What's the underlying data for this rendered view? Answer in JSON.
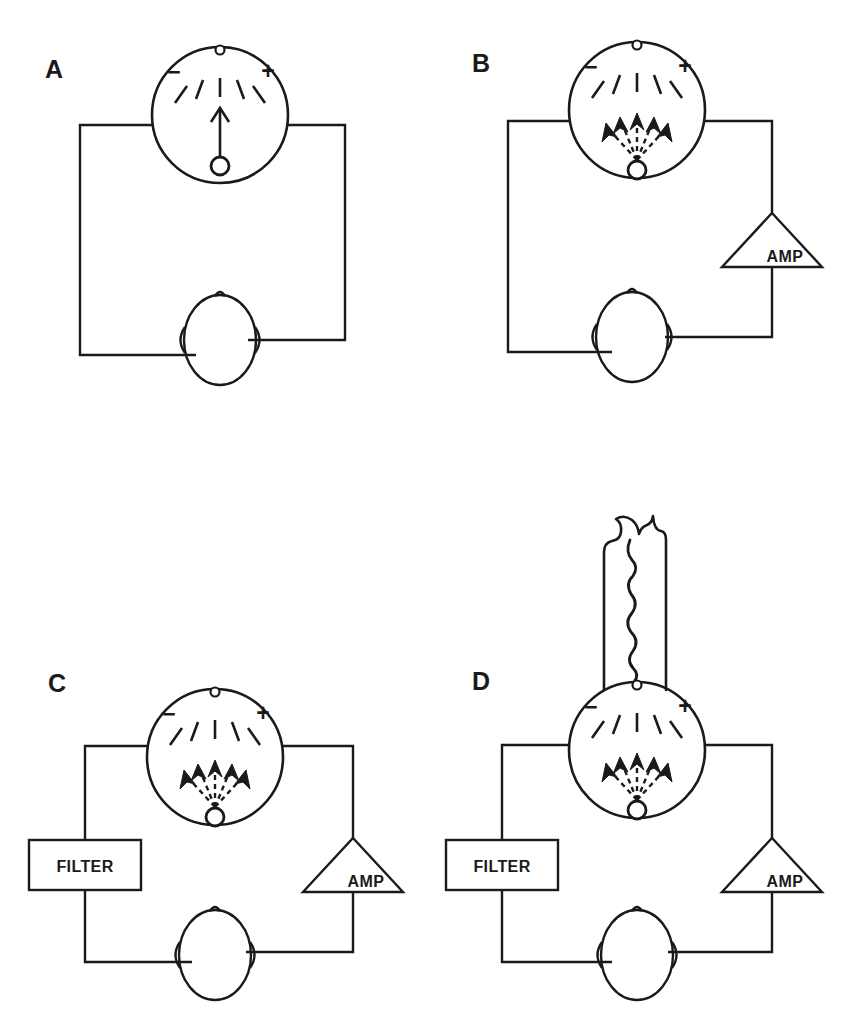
{
  "figure": {
    "background_color": "#ffffff",
    "ink_color": "#1a1a1a",
    "width": 845,
    "height": 1036
  },
  "meter": {
    "scale_minus": "−",
    "scale_plus": "+",
    "tick_count": 5,
    "top_dot_name": "dial-top-dot"
  },
  "components": {
    "amp_label": "AMP",
    "filter_label": "FILTER"
  },
  "panels": [
    {
      "id": "A",
      "label": "A",
      "label_x": 45,
      "label_y": 78,
      "meter_cx": 220,
      "meter_cy": 115,
      "meter_r": 68,
      "head_cx": 220,
      "head_cy": 340,
      "needle_mode": "steady",
      "has_amp": false,
      "has_filter": false,
      "has_strip": false,
      "left_wire_x": 80,
      "right_wire_x": 345,
      "bottom_wire_y": 355,
      "wire_top_y": 125
    },
    {
      "id": "B",
      "label": "B",
      "label_x": 472,
      "label_y": 72,
      "meter_cx": 637,
      "meter_cy": 110,
      "meter_r": 68,
      "head_cx": 632,
      "head_cy": 337,
      "needle_mode": "fluttering",
      "has_amp": true,
      "has_filter": false,
      "has_strip": false,
      "left_wire_x": 508,
      "right_wire_x": 772,
      "bottom_wire_y": 352,
      "wire_top_y": 121,
      "amp_cx": 772,
      "amp_cy": 240
    },
    {
      "id": "C",
      "label": "C",
      "label_x": 48,
      "label_y": 692,
      "meter_cx": 215,
      "meter_cy": 757,
      "meter_r": 68,
      "head_cx": 215,
      "head_cy": 955,
      "needle_mode": "fluttering",
      "has_amp": true,
      "has_filter": true,
      "has_strip": false,
      "left_wire_x": 85,
      "right_wire_x": 353,
      "bottom_wire_y": 962,
      "wire_top_y": 746,
      "amp_cx": 353,
      "amp_cy": 865,
      "filter_cx": 85,
      "filter_cy": 865
    },
    {
      "id": "D",
      "label": "D",
      "label_x": 472,
      "label_y": 690,
      "meter_cx": 637,
      "meter_cy": 750,
      "meter_r": 68,
      "head_cx": 637,
      "head_cy": 955,
      "needle_mode": "fluttering",
      "has_amp": true,
      "has_filter": true,
      "has_strip": true,
      "left_wire_x": 502,
      "right_wire_x": 772,
      "bottom_wire_y": 962,
      "wire_top_y": 745,
      "amp_cx": 772,
      "amp_cy": 865,
      "filter_cx": 502,
      "filter_cy": 865,
      "strip_x": 604,
      "strip_top": 518,
      "strip_width": 62,
      "strip_bottom": 690
    }
  ]
}
